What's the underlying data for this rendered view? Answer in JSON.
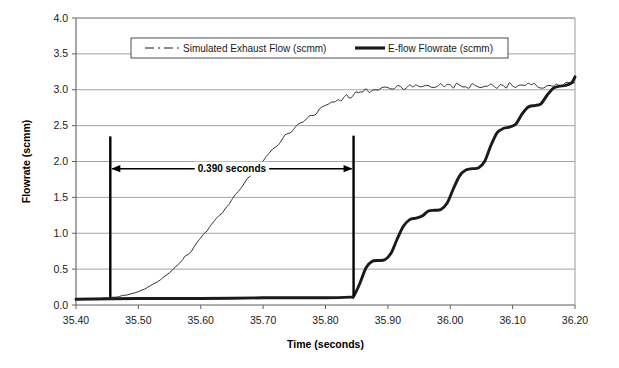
{
  "chart_data": {
    "type": "line",
    "title": "",
    "xlabel": "Time (seconds)",
    "ylabel": "Flowrate (scmm)",
    "xlim": [
      35.4,
      36.2
    ],
    "ylim": [
      0.0,
      4.0
    ],
    "xticks": [
      "35.40",
      "35.50",
      "35.60",
      "35.70",
      "35.80",
      "35.90",
      "36.00",
      "36.10",
      "36.20"
    ],
    "yticks": [
      "0.0",
      "0.5",
      "1.0",
      "1.5",
      "2.0",
      "2.5",
      "3.0",
      "3.5",
      "4.0"
    ],
    "grid": "horizontal",
    "legend_position": "top-center",
    "series": [
      {
        "name": "Simulated Exhaust Flow (scmm)",
        "style": "dash-dot-thin",
        "color": "#2b2b2b",
        "x": [
          35.4,
          35.42,
          35.44,
          35.455,
          35.47,
          35.49,
          35.51,
          35.53,
          35.55,
          35.57,
          35.59,
          35.61,
          35.63,
          35.65,
          35.67,
          35.69,
          35.71,
          35.73,
          35.75,
          35.77,
          35.79,
          35.81,
          35.83,
          35.845,
          35.86,
          35.88,
          35.9,
          35.92,
          35.94,
          35.96,
          35.98,
          36.0,
          36.02,
          36.04,
          36.06,
          36.08,
          36.1,
          36.12,
          36.14,
          36.16,
          36.18,
          36.2
        ],
        "y": [
          0.08,
          0.08,
          0.09,
          0.1,
          0.12,
          0.16,
          0.22,
          0.32,
          0.45,
          0.62,
          0.82,
          1.03,
          1.25,
          1.47,
          1.7,
          1.92,
          2.12,
          2.3,
          2.46,
          2.6,
          2.73,
          2.83,
          2.9,
          2.93,
          2.97,
          3.0,
          3.03,
          3.05,
          3.04,
          3.06,
          3.05,
          3.07,
          3.04,
          3.06,
          3.05,
          3.07,
          3.05,
          3.06,
          3.04,
          3.06,
          3.05,
          3.1
        ]
      },
      {
        "name": "E-flow Flowrate (scmm)",
        "style": "solid-thick",
        "color": "#1a1a1a",
        "x": [
          35.4,
          35.5,
          35.6,
          35.7,
          35.8,
          35.84,
          35.845,
          35.855,
          35.865,
          35.875,
          35.885,
          35.895,
          35.905,
          35.915,
          35.925,
          35.935,
          35.945,
          35.955,
          35.965,
          35.975,
          35.985,
          35.995,
          36.005,
          36.015,
          36.025,
          36.035,
          36.045,
          36.055,
          36.065,
          36.075,
          36.085,
          36.095,
          36.105,
          36.115,
          36.125,
          36.135,
          36.145,
          36.155,
          36.165,
          36.175,
          36.185,
          36.195,
          36.2
        ],
        "y": [
          0.08,
          0.09,
          0.09,
          0.1,
          0.1,
          0.11,
          0.12,
          0.3,
          0.52,
          0.61,
          0.62,
          0.63,
          0.72,
          0.92,
          1.1,
          1.19,
          1.21,
          1.24,
          1.31,
          1.32,
          1.33,
          1.42,
          1.62,
          1.8,
          1.88,
          1.9,
          1.91,
          2.0,
          2.22,
          2.4,
          2.46,
          2.48,
          2.52,
          2.66,
          2.76,
          2.78,
          2.8,
          2.92,
          3.02,
          3.05,
          3.06,
          3.1,
          3.18
        ]
      }
    ],
    "annotations": [
      {
        "type": "vertical-marker",
        "x": 35.455,
        "y_from": 0.1,
        "y_to": 2.35
      },
      {
        "type": "vertical-marker",
        "x": 35.845,
        "y_from": 0.12,
        "y_to": 2.36
      },
      {
        "type": "double-arrow-span",
        "label": "0.390 seconds",
        "x_from": 35.455,
        "x_to": 35.845,
        "y": 1.9
      }
    ]
  },
  "legend": {
    "items": [
      {
        "label": "Simulated Exhaust Flow (scmm)",
        "marker": "dash-dot-line-swatch"
      },
      {
        "label": "E-flow Flowrate (scmm)",
        "marker": "thick-solid-line-swatch"
      }
    ]
  },
  "colors": {
    "plot_background": "#ffffff",
    "gridline": "#9a9a9a",
    "axis": "#555555",
    "series_simulated": "#2b2b2b",
    "series_eflow": "#1a1a1a",
    "annotation": "#000000"
  }
}
